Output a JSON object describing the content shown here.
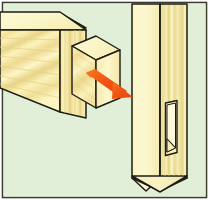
{
  "figure": {
    "name": "mortise-and-tenon-joint",
    "title": "Mortise and tenon joint assembly",
    "width": 209,
    "height": 200,
    "background_color": "#e2efd8",
    "frame_color": "#3a3a2e",
    "frame_inner_color": "#ffffff"
  },
  "palette": {
    "wood_light": "#fdf6c8",
    "wood_pale": "#faf3be",
    "wood_mid": "#f3e49a",
    "wood_grain_dark": "#e3c97e",
    "wood_grain_darker": "#d9b968",
    "wood_shadow": "#efe0a0",
    "outline": "#1c1c14",
    "arrow_fill": "#f04c12",
    "arrow_fill_light": "#f8711f",
    "background_green": "#e2efd8",
    "background_green_edge": "#d7e9c9"
  },
  "parts": [
    {
      "id": "beam",
      "label": "Horizontal rail with tenon",
      "faces": [
        {
          "id": "beam-top-face",
          "label": "Rail top face",
          "tone": "#fdf7cd"
        },
        {
          "id": "beam-front-face",
          "label": "Rail front face with grain",
          "tone": "#f7e9a6"
        },
        {
          "id": "beam-end-face",
          "label": "Rail shoulder end face",
          "tone": "#f6eab0"
        }
      ]
    },
    {
      "id": "tenon",
      "label": "Tenon tongue",
      "faces": [
        {
          "id": "tenon-top-face",
          "label": "Tenon top face",
          "tone": "#fdf7cd"
        },
        {
          "id": "tenon-front-face",
          "label": "Tenon front face",
          "tone": "#f5e6a2"
        },
        {
          "id": "tenon-end-face",
          "label": "Tenon end face",
          "tone": "#f9efba"
        }
      ]
    },
    {
      "id": "post",
      "label": "Vertical stile with mortise",
      "faces": [
        {
          "id": "post-left-face",
          "label": "Stile left face",
          "tone": "#f9f2c4"
        },
        {
          "id": "post-right-face",
          "label": "Stile right face with grain",
          "tone": "#f6eaa8"
        },
        {
          "id": "post-bottom-face",
          "label": "Stile bottom bevel",
          "tone": "#f2e7b4"
        }
      ]
    },
    {
      "id": "mortise",
      "label": "Mortise slot cut into stile",
      "faces": [
        {
          "id": "mortise-opening",
          "label": "Mortise opening",
          "tone": "#f6eaa8"
        },
        {
          "id": "mortise-inner-wall",
          "label": "Mortise inner wall",
          "tone": "#ffffff"
        }
      ]
    },
    {
      "id": "arrow",
      "label": "Assembly direction arrow",
      "direction": "down-right",
      "color": "#f04c12"
    }
  ],
  "annotations": {
    "caption": "",
    "arrow_meaning": "Insert tenon into mortise"
  }
}
